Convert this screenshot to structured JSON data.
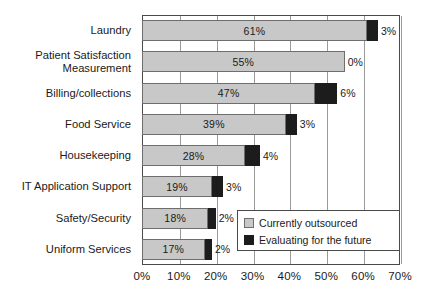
{
  "chart_data": {
    "type": "bar",
    "orientation": "horizontal",
    "stacked": true,
    "title": "",
    "subtitle": "",
    "xlabel": "",
    "ylabel": "",
    "xlim": [
      0,
      70
    ],
    "xtick_labels": [
      "0%",
      "10%",
      "20%",
      "30%",
      "40%",
      "50%",
      "60%",
      "70%"
    ],
    "xtick_values": [
      0,
      10,
      20,
      30,
      40,
      50,
      60,
      70
    ],
    "grid": true,
    "grid_axis": "x",
    "legend_position": "bottom-right-inside",
    "categories": [
      "Laundry",
      "Patient Satisfaction Measurement",
      "Billing/collections",
      "Food Service",
      "Housekeeping",
      "IT Application Support",
      "Safety/Security",
      "Uniform Services"
    ],
    "series": [
      {
        "name": "Currently outsourced",
        "color": "#c8c8c8",
        "values": [
          61,
          55,
          47,
          39,
          28,
          19,
          18,
          17
        ],
        "labels": [
          "61%",
          "55%",
          "47%",
          "39%",
          "28%",
          "19%",
          "18%",
          "17%"
        ]
      },
      {
        "name": "Evaluating for the future",
        "color": "#1c1c1c",
        "values": [
          3,
          0,
          6,
          3,
          4,
          3,
          2,
          2
        ],
        "labels": [
          "3%",
          "0%",
          "6%",
          "3%",
          "4%",
          "3%",
          "2%",
          "2%"
        ]
      }
    ]
  },
  "axis": {
    "ticks": [
      {
        "label": "0%",
        "value": 0
      },
      {
        "label": "10%",
        "value": 10
      },
      {
        "label": "20%",
        "value": 20
      },
      {
        "label": "30%",
        "value": 30
      },
      {
        "label": "40%",
        "value": 40
      },
      {
        "label": "50%",
        "value": 50
      },
      {
        "label": "60%",
        "value": 60
      },
      {
        "label": "70%",
        "value": 70
      }
    ]
  },
  "rows": [
    {
      "category": "Laundry",
      "line1": "Laundry",
      "line2": "",
      "gray": 61,
      "black": 3,
      "gray_label": "61%",
      "black_label": "3%"
    },
    {
      "category": "Patient Satisfaction Measurement",
      "line1": "Patient Satisfaction",
      "line2": "Measurement",
      "gray": 55,
      "black": 0,
      "gray_label": "55%",
      "black_label": "0%"
    },
    {
      "category": "Billing/collections",
      "line1": "Billing/collections",
      "line2": "",
      "gray": 47,
      "black": 6,
      "gray_label": "47%",
      "black_label": "6%"
    },
    {
      "category": "Food Service",
      "line1": "Food Service",
      "line2": "",
      "gray": 39,
      "black": 3,
      "gray_label": "39%",
      "black_label": "3%"
    },
    {
      "category": "Housekeeping",
      "line1": "Housekeeping",
      "line2": "",
      "gray": 28,
      "black": 4,
      "gray_label": "28%",
      "black_label": "4%"
    },
    {
      "category": "IT Application Support",
      "line1": "IT Application Support",
      "line2": "",
      "gray": 19,
      "black": 3,
      "gray_label": "19%",
      "black_label": "3%"
    },
    {
      "category": "Safety/Security",
      "line1": "Safety/Security",
      "line2": "",
      "gray": 18,
      "black": 2,
      "gray_label": "18%",
      "black_label": "2%"
    },
    {
      "category": "Uniform Services",
      "line1": "Uniform Services",
      "line2": "",
      "gray": 17,
      "black": 2,
      "gray_label": "17%",
      "black_label": "2%"
    }
  ],
  "legend": {
    "items": [
      {
        "label": "Currently outsourced",
        "color": "#c8c8c8",
        "swatch": "gray"
      },
      {
        "label": "Evaluating for the future",
        "color": "#1c1c1c",
        "swatch": "black"
      }
    ]
  },
  "colors": {
    "outsourced": "#c8c8c8",
    "evaluating": "#1c1c1c",
    "frame": "#4a4a4a",
    "grid": "#9a9a9a",
    "text": "#1a1a1a",
    "background": "#ffffff"
  }
}
